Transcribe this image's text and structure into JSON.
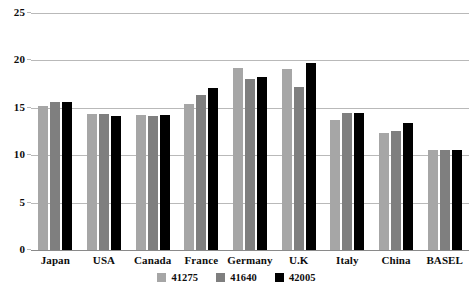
{
  "chart_data": {
    "type": "bar",
    "title": "",
    "subtitle": "",
    "xlabel": "",
    "ylabel": "",
    "ylim": [
      0,
      25
    ],
    "yticks": [
      0,
      5,
      10,
      15,
      20,
      25
    ],
    "grid": true,
    "legend_position": "bottom",
    "categories": [
      "Japan",
      "USA",
      "Canada",
      "France",
      "Germany",
      "U.K",
      "Italy",
      "China",
      "BASEL"
    ],
    "series": [
      {
        "name": "41275",
        "color": "#a6a6a6",
        "values": [
          15.2,
          14.3,
          14.2,
          15.4,
          19.2,
          19.1,
          13.7,
          12.3,
          10.6
        ]
      },
      {
        "name": "41640",
        "color": "#7f7f7f",
        "values": [
          15.6,
          14.3,
          14.1,
          16.3,
          18.0,
          17.2,
          14.5,
          12.6,
          10.5
        ]
      },
      {
        "name": "42005",
        "color": "#000000",
        "values": [
          15.6,
          14.1,
          14.2,
          17.1,
          18.3,
          19.7,
          14.5,
          13.4,
          10.5
        ]
      }
    ]
  },
  "axis": {
    "tick_labels": [
      "25",
      "20",
      "15",
      "10",
      "5",
      "0"
    ]
  }
}
